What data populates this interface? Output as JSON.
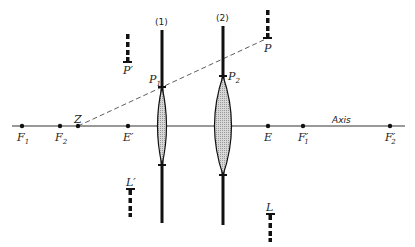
{
  "diagram": {
    "type": "thick-lens-system optics diagram",
    "axis_label": "Axis",
    "lenses": [
      {
        "id": "lens-1",
        "label": "(1)",
        "x": 162,
        "principal_point": "P1"
      },
      {
        "id": "lens-2",
        "label": "(2)",
        "x": 223,
        "principal_point": "P2"
      }
    ],
    "axis_points": [
      {
        "name": "F1",
        "text": "F",
        "sub": "1",
        "x": 22
      },
      {
        "name": "F2",
        "text": "F",
        "sub": "2",
        "x": 60
      },
      {
        "name": "Z",
        "text": "Z",
        "sub": "",
        "x": 78
      },
      {
        "name": "E-prime",
        "text": "E′",
        "sub": "",
        "x": 128
      },
      {
        "name": "E",
        "text": "E",
        "sub": "",
        "x": 268
      },
      {
        "name": "F1-prime",
        "text": "F′",
        "sub": "1",
        "x": 303
      },
      {
        "name": "F2-prime",
        "text": "F′",
        "sub": "2",
        "x": 390
      }
    ],
    "objects": [
      {
        "name": "P",
        "text": "P"
      },
      {
        "name": "P-prime",
        "text": "P′"
      },
      {
        "name": "L",
        "text": "L"
      },
      {
        "name": "L-prime",
        "text": "L′"
      },
      {
        "name": "P1",
        "text": "P",
        "sub": "1"
      },
      {
        "name": "P2",
        "text": "P",
        "sub": "2"
      }
    ]
  }
}
